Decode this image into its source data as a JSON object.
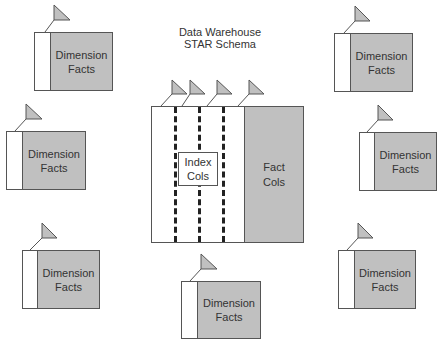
{
  "title": {
    "line1": "Data Warehouse",
    "line2": "STAR Schema"
  },
  "fact_table": {
    "index_label_1": "Index",
    "index_label_2": "Cols",
    "fact_label_1": "Fact",
    "fact_label_2": "Cols",
    "index_column_count": 4
  },
  "dimensions": [
    {
      "id": "top-left",
      "line1": "Dimension",
      "line2": "Facts"
    },
    {
      "id": "middle-left",
      "line1": "Dimension",
      "line2": "Facts"
    },
    {
      "id": "bottom-left",
      "line1": "Dimension",
      "line2": "Facts"
    },
    {
      "id": "bottom-center",
      "line1": "Dimension",
      "line2": "Facts"
    },
    {
      "id": "top-right",
      "line1": "Dimension",
      "line2": "Facts"
    },
    {
      "id": "middle-right",
      "line1": "Dimension",
      "line2": "Facts"
    },
    {
      "id": "bottom-right",
      "line1": "Dimension",
      "line2": "Facts"
    }
  ],
  "colors": {
    "fill_gray": "#c0c0c0",
    "border": "#555555",
    "text": "#333333",
    "background": "#ffffff"
  }
}
